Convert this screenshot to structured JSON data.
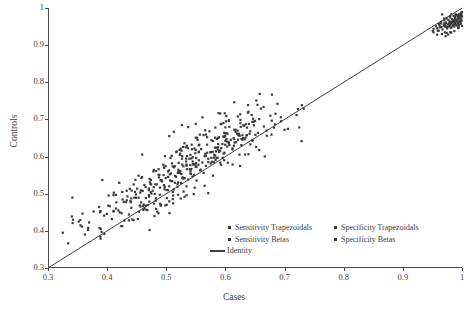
{
  "chart_data": {
    "type": "scatter",
    "title": "",
    "xlabel": "Cases",
    "ylabel": "Controls",
    "xlim": [
      0.3,
      1.0
    ],
    "ylim": [
      0.3,
      1.0
    ],
    "xticks": [
      "0.3",
      "0.4",
      "0.5",
      "0.6",
      "0.7",
      "0.8",
      "0.9",
      "1"
    ],
    "xtick_values": [
      0.3,
      0.4,
      0.5,
      0.6,
      0.7,
      0.8,
      0.9,
      1.0
    ],
    "yticks": [
      "0.3",
      "0.4",
      "0.5",
      "0.6",
      "0.7",
      "0.8",
      "0.9",
      "1"
    ],
    "ytick_values": [
      0.3,
      0.4,
      0.5,
      0.6,
      0.7,
      0.8,
      0.9,
      1.0
    ],
    "grid": false,
    "legend_position": "inside-bottom-center",
    "marker_color": "#3b3b3b",
    "line_color": "#404040",
    "background": "#ffffff",
    "legend": [
      {
        "name": "Sensitivity Trapezoidals",
        "marker": "square",
        "color": "#3b3b3b"
      },
      {
        "name": "Specificity Trapezoidals",
        "marker": "square",
        "color": "#3b3b3b"
      },
      {
        "name": "Sensitivity Betas",
        "marker": "square",
        "color": "#3b3b3b"
      },
      {
        "name": "Specificity Betas",
        "marker": "square",
        "color": "#3b3b3b"
      },
      {
        "name": "Identity",
        "marker": "line",
        "color": "#404040"
      }
    ],
    "reference_line": {
      "name": "Identity",
      "from": [
        0.3,
        0.3
      ],
      "to": [
        1.0,
        1.0
      ]
    },
    "series": [
      {
        "name": "Main scatter cloud",
        "points": [
          [
            0.325,
            0.395
          ],
          [
            0.352,
            0.425
          ],
          [
            0.368,
            0.408
          ],
          [
            0.377,
            0.452
          ],
          [
            0.389,
            0.379
          ],
          [
            0.395,
            0.441
          ],
          [
            0.402,
            0.468
          ],
          [
            0.408,
            0.432
          ],
          [
            0.415,
            0.497
          ],
          [
            0.419,
            0.455
          ],
          [
            0.424,
            0.413
          ],
          [
            0.428,
            0.478
          ],
          [
            0.433,
            0.508
          ],
          [
            0.437,
            0.444
          ],
          [
            0.441,
            0.462
          ],
          [
            0.445,
            0.525
          ],
          [
            0.449,
            0.489
          ],
          [
            0.452,
            0.432
          ],
          [
            0.456,
            0.503
          ],
          [
            0.459,
            0.545
          ],
          [
            0.462,
            0.471
          ],
          [
            0.465,
            0.518
          ],
          [
            0.468,
            0.456
          ],
          [
            0.471,
            0.492
          ],
          [
            0.474,
            0.537
          ],
          [
            0.477,
            0.508
          ],
          [
            0.479,
            0.564
          ],
          [
            0.482,
            0.481
          ],
          [
            0.484,
            0.525
          ],
          [
            0.487,
            0.551
          ],
          [
            0.489,
            0.497
          ],
          [
            0.491,
            0.47
          ],
          [
            0.493,
            0.533
          ],
          [
            0.495,
            0.578
          ],
          [
            0.497,
            0.512
          ],
          [
            0.499,
            0.542
          ],
          [
            0.501,
            0.488
          ],
          [
            0.503,
            0.56
          ],
          [
            0.505,
            0.52
          ],
          [
            0.507,
            0.596
          ],
          [
            0.509,
            0.534
          ],
          [
            0.511,
            0.505
          ],
          [
            0.513,
            0.571
          ],
          [
            0.515,
            0.548
          ],
          [
            0.517,
            0.612
          ],
          [
            0.519,
            0.519
          ],
          [
            0.521,
            0.583
          ],
          [
            0.523,
            0.556
          ],
          [
            0.525,
            0.529
          ],
          [
            0.527,
            0.601
          ],
          [
            0.529,
            0.574
          ],
          [
            0.531,
            0.542
          ],
          [
            0.533,
            0.625
          ],
          [
            0.535,
            0.566
          ],
          [
            0.537,
            0.538
          ],
          [
            0.539,
            0.594
          ],
          [
            0.541,
            0.561
          ],
          [
            0.543,
            0.632
          ],
          [
            0.545,
            0.58
          ],
          [
            0.547,
            0.551
          ],
          [
            0.549,
            0.609
          ],
          [
            0.551,
            0.572
          ],
          [
            0.553,
            0.645
          ],
          [
            0.555,
            0.59
          ],
          [
            0.557,
            0.563
          ],
          [
            0.559,
            0.62
          ],
          [
            0.561,
            0.584
          ],
          [
            0.563,
            0.658
          ],
          [
            0.565,
            0.601
          ],
          [
            0.567,
            0.575
          ],
          [
            0.569,
            0.632
          ],
          [
            0.571,
            0.594
          ],
          [
            0.573,
            0.668
          ],
          [
            0.575,
            0.612
          ],
          [
            0.577,
            0.586
          ],
          [
            0.579,
            0.642
          ],
          [
            0.581,
            0.605
          ],
          [
            0.583,
            0.678
          ],
          [
            0.585,
            0.624
          ],
          [
            0.587,
            0.597
          ],
          [
            0.589,
            0.652
          ],
          [
            0.591,
            0.616
          ],
          [
            0.593,
            0.688
          ],
          [
            0.595,
            0.634
          ],
          [
            0.597,
            0.608
          ],
          [
            0.6,
            0.662
          ],
          [
            0.603,
            0.627
          ],
          [
            0.606,
            0.698
          ],
          [
            0.609,
            0.645
          ],
          [
            0.612,
            0.619
          ],
          [
            0.615,
            0.672
          ],
          [
            0.618,
            0.639
          ],
          [
            0.621,
            0.708
          ],
          [
            0.624,
            0.656
          ],
          [
            0.627,
            0.631
          ],
          [
            0.63,
            0.684
          ],
          [
            0.634,
            0.651
          ],
          [
            0.638,
            0.718
          ],
          [
            0.642,
            0.668
          ],
          [
            0.646,
            0.643
          ],
          [
            0.65,
            0.696
          ],
          [
            0.655,
            0.664
          ],
          [
            0.66,
            0.729
          ],
          [
            0.665,
            0.681
          ],
          [
            0.67,
            0.656
          ],
          [
            0.676,
            0.71
          ],
          [
            0.682,
            0.678
          ],
          [
            0.688,
            0.742
          ],
          [
            0.694,
            0.695
          ],
          [
            0.7,
            0.672
          ]
        ]
      },
      {
        "name": "Top-right cluster",
        "points": [
          [
            0.952,
            0.944
          ],
          [
            0.956,
            0.951
          ],
          [
            0.959,
            0.939
          ],
          [
            0.961,
            0.957
          ],
          [
            0.963,
            0.948
          ],
          [
            0.965,
            0.962
          ],
          [
            0.967,
            0.942
          ],
          [
            0.969,
            0.955
          ],
          [
            0.97,
            0.967
          ],
          [
            0.972,
            0.949
          ],
          [
            0.973,
            0.96
          ],
          [
            0.974,
            0.972
          ],
          [
            0.975,
            0.945
          ],
          [
            0.976,
            0.956
          ],
          [
            0.977,
            0.968
          ],
          [
            0.978,
            0.951
          ],
          [
            0.979,
            0.963
          ],
          [
            0.98,
            0.975
          ],
          [
            0.981,
            0.947
          ],
          [
            0.982,
            0.959
          ],
          [
            0.983,
            0.97
          ],
          [
            0.984,
            0.954
          ],
          [
            0.985,
            0.966
          ],
          [
            0.986,
            0.978
          ],
          [
            0.987,
            0.95
          ],
          [
            0.988,
            0.961
          ],
          [
            0.988,
            0.973
          ],
          [
            0.989,
            0.957
          ],
          [
            0.99,
            0.969
          ],
          [
            0.991,
            0.981
          ],
          [
            0.991,
            0.953
          ],
          [
            0.992,
            0.964
          ],
          [
            0.993,
            0.976
          ],
          [
            0.993,
            0.959
          ],
          [
            0.994,
            0.971
          ],
          [
            0.995,
            0.983
          ],
          [
            0.995,
            0.955
          ],
          [
            0.996,
            0.966
          ],
          [
            0.996,
            0.978
          ],
          [
            0.997,
            0.962
          ],
          [
            0.997,
            0.974
          ],
          [
            0.998,
            0.986
          ],
          [
            0.998,
            0.958
          ],
          [
            0.999,
            0.969
          ],
          [
            0.999,
            0.981
          ],
          [
            0.999,
            0.965
          ],
          [
            1.0,
            0.977
          ],
          [
            1.0,
            0.989
          ],
          [
            1.0,
            0.952
          ],
          [
            0.994,
            0.947
          ],
          [
            0.987,
            0.938
          ],
          [
            0.98,
            0.935
          ],
          [
            0.974,
            0.933
          ],
          [
            0.966,
            0.93
          ],
          [
            0.958,
            0.928
          ]
        ]
      }
    ]
  }
}
